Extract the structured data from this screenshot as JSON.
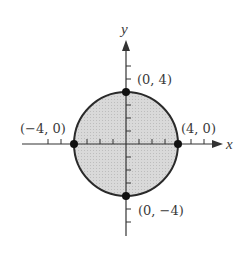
{
  "figure": {
    "type": "circle_region",
    "equation": "x^2 + y^2 <= 16",
    "axes": {
      "x_label": "x",
      "y_label": "y"
    },
    "points": [
      {
        "label": "(0, 4)",
        "x": 0,
        "y": 4
      },
      {
        "label": "(−4, 0)",
        "x": -4,
        "y": 0
      },
      {
        "label": "(4, 0)",
        "x": 4,
        "y": 0
      },
      {
        "label": "(0, −4)",
        "x": 0,
        "y": -4
      }
    ],
    "colors": {
      "fill": "#d6d6d6",
      "stroke": "#2a2a2a",
      "text": "#3a3a3a"
    }
  }
}
